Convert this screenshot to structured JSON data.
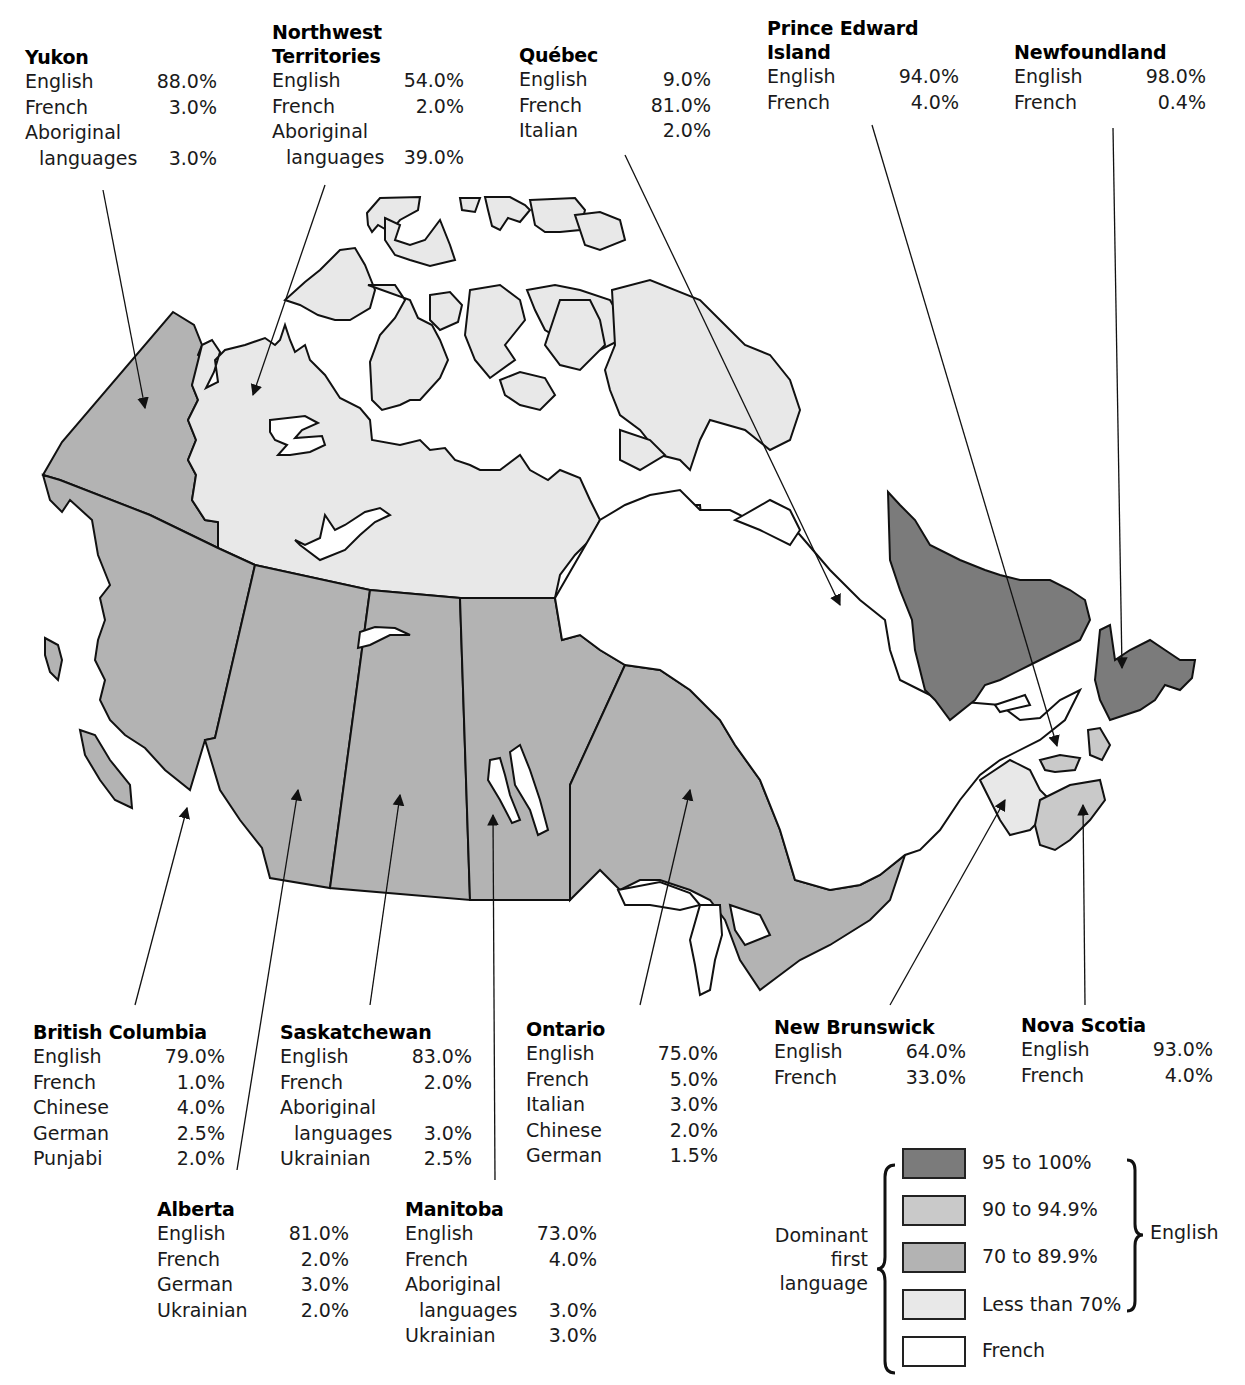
{
  "title_fragment": "",
  "colors": {
    "english_95_100": "#7b7b7b",
    "english_90_94_9": "#c9c9c9",
    "english_70_89_9": "#b3b3b3",
    "english_less_70": "#e8e8e8",
    "french": "#ffffff",
    "outline": "#111111"
  },
  "provinces": {
    "yukon": {
      "name": "Yukon",
      "lines": [
        {
          "lang": "English",
          "val": "88.0%"
        },
        {
          "lang": "French",
          "val": "3.0%"
        },
        {
          "lang": "Aboriginal",
          "val": ""
        },
        {
          "lang": "languages",
          "val": "3.0%",
          "indent": true
        }
      ]
    },
    "nwt": {
      "name1": "Northwest",
      "name2": "Territories",
      "lines": [
        {
          "lang": "English",
          "val": "54.0%"
        },
        {
          "lang": "French",
          "val": "2.0%"
        },
        {
          "lang": "Aboriginal",
          "val": ""
        },
        {
          "lang": "languages",
          "val": "39.0%",
          "indent": true
        }
      ]
    },
    "quebec": {
      "name": "Québec",
      "lines": [
        {
          "lang": "English",
          "val": "9.0%"
        },
        {
          "lang": "French",
          "val": "81.0%"
        },
        {
          "lang": "Italian",
          "val": "2.0%"
        }
      ]
    },
    "pei": {
      "name1": "Prince Edward",
      "name2": "Island",
      "lines": [
        {
          "lang": "English",
          "val": "94.0%"
        },
        {
          "lang": "French",
          "val": "4.0%"
        }
      ]
    },
    "newfoundland": {
      "name": "Newfoundland",
      "lines": [
        {
          "lang": "English",
          "val": "98.0%"
        },
        {
          "lang": "French",
          "val": "0.4%"
        }
      ]
    },
    "bc": {
      "name": "British Columbia",
      "lines": [
        {
          "lang": "English",
          "val": "79.0%"
        },
        {
          "lang": "French",
          "val": "1.0%"
        },
        {
          "lang": "Chinese",
          "val": "4.0%"
        },
        {
          "lang": "German",
          "val": "2.5%"
        },
        {
          "lang": "Punjabi",
          "val": "2.0%"
        }
      ]
    },
    "saskatchewan": {
      "name": "Saskatchewan",
      "lines": [
        {
          "lang": "English",
          "val": "83.0%"
        },
        {
          "lang": "French",
          "val": "2.0%"
        },
        {
          "lang": "Aboriginal",
          "val": ""
        },
        {
          "lang": "languages",
          "val": "3.0%",
          "indent": true
        },
        {
          "lang": "Ukrainian",
          "val": "2.5%"
        }
      ]
    },
    "ontario": {
      "name": "Ontario",
      "lines": [
        {
          "lang": "English",
          "val": "75.0%"
        },
        {
          "lang": "French",
          "val": "5.0%"
        },
        {
          "lang": "Italian",
          "val": "3.0%"
        },
        {
          "lang": "Chinese",
          "val": "2.0%"
        },
        {
          "lang": "German",
          "val": "1.5%"
        }
      ]
    },
    "new_brunswick": {
      "name": "New Brunswick",
      "lines": [
        {
          "lang": "English",
          "val": "64.0%"
        },
        {
          "lang": "French",
          "val": "33.0%"
        }
      ]
    },
    "nova_scotia": {
      "name": "Nova Scotia",
      "lines": [
        {
          "lang": "English",
          "val": "93.0%"
        },
        {
          "lang": "French",
          "val": "4.0%"
        }
      ]
    },
    "alberta": {
      "name": "Alberta",
      "lines": [
        {
          "lang": "English",
          "val": "81.0%"
        },
        {
          "lang": "French",
          "val": "2.0%"
        },
        {
          "lang": "German",
          "val": "3.0%"
        },
        {
          "lang": "Ukrainian",
          "val": "2.0%"
        }
      ]
    },
    "manitoba": {
      "name": "Manitoba",
      "lines": [
        {
          "lang": "English",
          "val": "73.0%"
        },
        {
          "lang": "French",
          "val": "4.0%"
        },
        {
          "lang": "Aboriginal",
          "val": ""
        },
        {
          "lang": "languages",
          "val": "3.0%",
          "indent": true
        },
        {
          "lang": "Ukrainian",
          "val": "3.0%"
        }
      ]
    }
  },
  "legend": {
    "left_label_1": "Dominant",
    "left_label_2": "first",
    "left_label_3": "language",
    "right_label": "English",
    "items": [
      {
        "label": "95 to 100%"
      },
      {
        "label": "90 to 94.9%"
      },
      {
        "label": "70 to 89.9%"
      },
      {
        "label": "Less than 70%"
      },
      {
        "label": "French"
      }
    ]
  }
}
